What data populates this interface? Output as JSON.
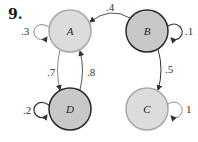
{
  "problem": {
    "number": "9."
  },
  "colors": {
    "light_fill": "#dcdcdc",
    "light_stroke": "#a8a8a8",
    "dark_fill": "#c8c8c8",
    "dark_stroke": "#2a2a2a",
    "edge": "#555555"
  },
  "nodes": [
    {
      "id": "A",
      "label": "A",
      "cx": 70,
      "cy": 31,
      "r": 21,
      "style": "light"
    },
    {
      "id": "B",
      "label": "B",
      "cx": 147,
      "cy": 31,
      "r": 21,
      "style": "dark"
    },
    {
      "id": "C",
      "label": "C",
      "cx": 147,
      "cy": 109,
      "r": 21,
      "style": "light"
    },
    {
      "id": "D",
      "label": "D",
      "cx": 70,
      "cy": 109,
      "r": 21,
      "style": "dark"
    }
  ],
  "edges": [
    {
      "from": "A",
      "to": "A",
      "label": ".3",
      "type": "self-loop-left"
    },
    {
      "from": "B",
      "to": "A",
      "label": ".4",
      "type": "arc-top"
    },
    {
      "from": "B",
      "to": "B",
      "label": ".1",
      "type": "self-loop-right"
    },
    {
      "from": "A",
      "to": "D",
      "label": ".7",
      "type": "vertical-left"
    },
    {
      "from": "D",
      "to": "A",
      "label": ".8",
      "type": "vertical-right"
    },
    {
      "from": "D",
      "to": "D",
      "label": ".2",
      "type": "self-loop-left"
    },
    {
      "from": "B",
      "to": "C",
      "label": ".5",
      "type": "vertical"
    },
    {
      "from": "C",
      "to": "C",
      "label": "1",
      "type": "self-loop-right"
    }
  ]
}
